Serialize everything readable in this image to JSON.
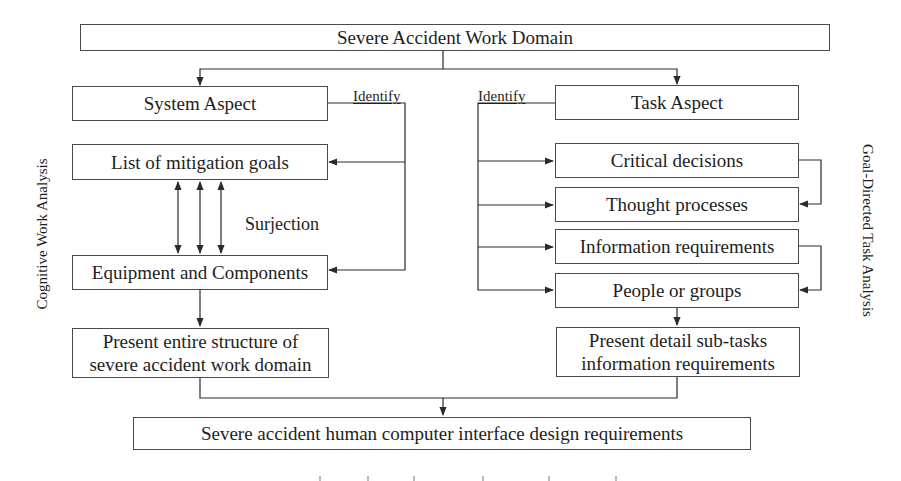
{
  "diagram": {
    "title_box": "Severe Accident Work Domain",
    "left_column": {
      "side_label": "Cognitive Work Analysis",
      "aspect": "System Aspect",
      "identify_label": "Identify",
      "goals": "List of mitigation goals",
      "relation_label": "Surjection",
      "components": "Equipment and Components",
      "output_line1": "Present entire structure of",
      "output_line2": "severe accident work domain"
    },
    "right_column": {
      "side_label": "Goal-Directed Task Analysis",
      "aspect": "Task Aspect",
      "identify_label": "Identify",
      "items": [
        "Critical decisions",
        "Thought processes",
        "Information requirements",
        "People or groups"
      ],
      "output_line1": "Present detail sub-tasks",
      "output_line2": "information requirements"
    },
    "final_box": "Severe accident human computer interface design requirements",
    "colors": {
      "line": "#2a2a2a",
      "box_border": "#4a4a4a",
      "text": "#1e1e1e",
      "background": "#ffffff"
    }
  }
}
